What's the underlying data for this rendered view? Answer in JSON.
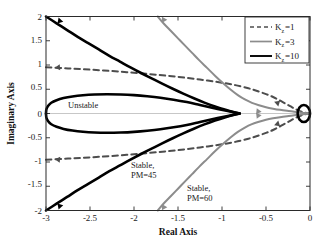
{
  "figure": {
    "background": "#ffffff",
    "frame_color": "#2a2a2a"
  },
  "chart_data": {
    "type": "line",
    "title": "",
    "xlabel": "Real Axis",
    "ylabel": "Imaginary Axis",
    "xlim": [
      -3,
      0
    ],
    "ylim": [
      -2,
      2
    ],
    "xticks": [
      -3,
      -2.5,
      -2,
      -1.5,
      -1,
      -0.5,
      0
    ],
    "xtick_labels": [
      "-3",
      "-2.5",
      "-2",
      "-1.5",
      "-1",
      "-0.5",
      "0"
    ],
    "yticks": [
      2,
      1.5,
      1,
      0.5,
      0,
      -0.5,
      -1,
      -1.5,
      -2
    ],
    "ytick_labels": [
      "2",
      "1.5",
      "1",
      "0.5",
      "0",
      "-0.5",
      "-1",
      "-1.5",
      "-2"
    ],
    "grid": false,
    "legend_position": "upper right",
    "series": [
      {
        "name": "K_z=1",
        "label_base": "K",
        "label_sub": "z",
        "label_value": "=1",
        "style": "dashed",
        "color": "#4d4d4d",
        "width": 2.0,
        "points_upper": [
          [
            -3.0,
            0.955
          ],
          [
            -2.75,
            0.93
          ],
          [
            -2.5,
            0.905
          ],
          [
            -2.25,
            0.875
          ],
          [
            -2.0,
            0.84
          ],
          [
            -1.75,
            0.8
          ],
          [
            -1.5,
            0.755
          ],
          [
            -1.25,
            0.7
          ],
          [
            -1.0,
            0.635
          ],
          [
            -0.85,
            0.585
          ],
          [
            -0.7,
            0.52
          ],
          [
            -0.6,
            0.465
          ],
          [
            -0.5,
            0.4
          ],
          [
            -0.42,
            0.34
          ],
          [
            -0.35,
            0.275
          ],
          [
            -0.28,
            0.205
          ],
          [
            -0.22,
            0.145
          ],
          [
            -0.17,
            0.095
          ],
          [
            -0.12,
            0.055
          ],
          [
            -0.07,
            0.025
          ],
          [
            -0.03,
            0.008
          ],
          [
            0.0,
            0.0
          ]
        ],
        "points_lower": [
          [
            -3.0,
            -0.955
          ],
          [
            -2.75,
            -0.93
          ],
          [
            -2.5,
            -0.905
          ],
          [
            -2.25,
            -0.875
          ],
          [
            -2.0,
            -0.84
          ],
          [
            -1.75,
            -0.8
          ],
          [
            -1.5,
            -0.755
          ],
          [
            -1.25,
            -0.7
          ],
          [
            -1.0,
            -0.635
          ],
          [
            -0.85,
            -0.585
          ],
          [
            -0.7,
            -0.52
          ],
          [
            -0.6,
            -0.465
          ],
          [
            -0.5,
            -0.4
          ],
          [
            -0.42,
            -0.34
          ],
          [
            -0.35,
            -0.275
          ],
          [
            -0.28,
            -0.205
          ],
          [
            -0.22,
            -0.145
          ],
          [
            -0.17,
            -0.095
          ],
          [
            -0.12,
            -0.055
          ],
          [
            -0.07,
            -0.025
          ],
          [
            -0.03,
            -0.008
          ],
          [
            0.0,
            0.0
          ]
        ]
      },
      {
        "name": "K_z=3",
        "label_base": "K",
        "label_sub": "z",
        "label_value": "=3",
        "style": "solid",
        "color": "#8c8c8c",
        "width": 2.0,
        "points_upper": [
          [
            -1.73,
            2.0
          ],
          [
            -1.66,
            1.85
          ],
          [
            -1.58,
            1.7
          ],
          [
            -1.5,
            1.55
          ],
          [
            -1.42,
            1.4
          ],
          [
            -1.34,
            1.25
          ],
          [
            -1.26,
            1.1
          ],
          [
            -1.17,
            0.94
          ],
          [
            -1.08,
            0.78
          ],
          [
            -0.99,
            0.63
          ],
          [
            -0.9,
            0.49
          ],
          [
            -0.82,
            0.38
          ],
          [
            -0.74,
            0.29
          ],
          [
            -0.66,
            0.22
          ],
          [
            -0.58,
            0.17
          ],
          [
            -0.5,
            0.13
          ],
          [
            -0.42,
            0.1
          ],
          [
            -0.34,
            0.075
          ],
          [
            -0.26,
            0.055
          ],
          [
            -0.18,
            0.038
          ],
          [
            -0.11,
            0.022
          ],
          [
            -0.05,
            0.009
          ],
          [
            0.0,
            0.0
          ]
        ],
        "points_lower": [
          [
            -1.73,
            -2.0
          ],
          [
            -1.66,
            -1.85
          ],
          [
            -1.58,
            -1.7
          ],
          [
            -1.5,
            -1.55
          ],
          [
            -1.42,
            -1.4
          ],
          [
            -1.34,
            -1.25
          ],
          [
            -1.26,
            -1.1
          ],
          [
            -1.17,
            -0.94
          ],
          [
            -1.08,
            -0.78
          ],
          [
            -0.99,
            -0.63
          ],
          [
            -0.9,
            -0.49
          ],
          [
            -0.82,
            -0.38
          ],
          [
            -0.74,
            -0.29
          ],
          [
            -0.66,
            -0.22
          ],
          [
            -0.58,
            -0.17
          ],
          [
            -0.5,
            -0.13
          ],
          [
            -0.42,
            -0.1
          ],
          [
            -0.34,
            -0.075
          ],
          [
            -0.26,
            -0.055
          ],
          [
            -0.18,
            -0.038
          ],
          [
            -0.11,
            -0.022
          ],
          [
            -0.05,
            -0.009
          ],
          [
            0.0,
            0.0
          ]
        ]
      },
      {
        "name": "K_z=10",
        "label_base": "K",
        "label_sub": "z",
        "label_value": "=10",
        "style": "solid",
        "color": "#000000",
        "width": 2.6,
        "branch_a_upper": [
          [
            -3.0,
            2.0
          ],
          [
            -2.88,
            1.86
          ],
          [
            -2.76,
            1.72
          ],
          [
            -2.64,
            1.58
          ],
          [
            -2.52,
            1.45
          ],
          [
            -2.4,
            1.32
          ],
          [
            -2.28,
            1.19
          ],
          [
            -2.16,
            1.07
          ],
          [
            -2.04,
            0.95
          ],
          [
            -1.92,
            0.835
          ],
          [
            -1.8,
            0.725
          ],
          [
            -1.68,
            0.615
          ],
          [
            -1.56,
            0.51
          ],
          [
            -1.44,
            0.41
          ],
          [
            -1.32,
            0.315
          ],
          [
            -1.2,
            0.225
          ],
          [
            -1.08,
            0.145
          ],
          [
            -0.96,
            0.075
          ],
          [
            -0.86,
            0.025
          ],
          [
            -0.8,
            0.0
          ]
        ],
        "branch_a_lower": [
          [
            -3.0,
            -2.0
          ],
          [
            -2.88,
            -1.86
          ],
          [
            -2.76,
            -1.72
          ],
          [
            -2.64,
            -1.58
          ],
          [
            -2.52,
            -1.45
          ],
          [
            -2.4,
            -1.32
          ],
          [
            -2.28,
            -1.19
          ],
          [
            -2.16,
            -1.07
          ],
          [
            -2.04,
            -0.95
          ],
          [
            -1.92,
            -0.835
          ],
          [
            -1.8,
            -0.725
          ],
          [
            -1.68,
            -0.615
          ],
          [
            -1.56,
            -0.51
          ],
          [
            -1.44,
            -0.41
          ],
          [
            -1.32,
            -0.315
          ],
          [
            -1.2,
            -0.225
          ],
          [
            -1.08,
            -0.145
          ],
          [
            -0.96,
            -0.075
          ],
          [
            -0.86,
            -0.025
          ],
          [
            -0.8,
            0.0
          ]
        ],
        "loop_upper": [
          [
            -0.8,
            0.0
          ],
          [
            -0.95,
            0.055
          ],
          [
            -1.1,
            0.115
          ],
          [
            -1.25,
            0.175
          ],
          [
            -1.4,
            0.235
          ],
          [
            -1.55,
            0.285
          ],
          [
            -1.7,
            0.325
          ],
          [
            -1.85,
            0.355
          ],
          [
            -2.0,
            0.378
          ],
          [
            -2.15,
            0.392
          ],
          [
            -2.3,
            0.398
          ],
          [
            -2.45,
            0.393
          ],
          [
            -2.58,
            0.378
          ],
          [
            -2.7,
            0.352
          ],
          [
            -2.8,
            0.318
          ],
          [
            -2.88,
            0.275
          ],
          [
            -2.94,
            0.222
          ],
          [
            -2.975,
            0.16
          ],
          [
            -2.995,
            0.09
          ],
          [
            -3.0,
            0.0
          ]
        ],
        "loop_lower": [
          [
            -0.8,
            0.0
          ],
          [
            -0.95,
            -0.055
          ],
          [
            -1.1,
            -0.115
          ],
          [
            -1.25,
            -0.175
          ],
          [
            -1.4,
            -0.235
          ],
          [
            -1.55,
            -0.285
          ],
          [
            -1.7,
            -0.325
          ],
          [
            -1.85,
            -0.355
          ],
          [
            -2.0,
            -0.378
          ],
          [
            -2.15,
            -0.392
          ],
          [
            -2.3,
            -0.398
          ],
          [
            -2.45,
            -0.393
          ],
          [
            -2.58,
            -0.378
          ],
          [
            -2.7,
            -0.352
          ],
          [
            -2.8,
            -0.318
          ],
          [
            -2.88,
            -0.275
          ],
          [
            -2.94,
            -0.222
          ],
          [
            -2.975,
            -0.16
          ],
          [
            -2.995,
            -0.09
          ],
          [
            -3.0,
            0.0
          ]
        ],
        "small_loop_note": "closed loop near origin"
      }
    ],
    "annotations": [
      {
        "text": "Unstable",
        "x": -2.22,
        "y": 0.3
      },
      {
        "text_line1": "Stable,",
        "text_line2": "PM=45",
        "x": -1.57,
        "y": -0.98
      },
      {
        "text_line1": "Stable,",
        "text_line2": "PM=60",
        "x": -0.94,
        "y": -1.52
      }
    ]
  },
  "legend": {
    "entries": [
      {
        "base": "K",
        "sub": "z",
        "rest": "=1",
        "style": "dashed",
        "color": "#4d4d4d"
      },
      {
        "base": "K",
        "sub": "z",
        "rest": "=3",
        "style": "solid",
        "color": "#8c8c8c"
      },
      {
        "base": "K",
        "sub": "z",
        "rest": "=10",
        "style": "solid",
        "color": "#000000"
      }
    ]
  },
  "annotations": {
    "unstable": "Unstable",
    "stable45_l1": "Stable,",
    "stable45_l2": "PM=45",
    "stable60_l1": "Stable,",
    "stable60_l2": "PM=60"
  },
  "axes": {
    "xlabel": "Real Axis",
    "ylabel": "Imaginary Axis",
    "x_tick_0": "-3",
    "x_tick_1": "-2.5",
    "x_tick_2": "-2",
    "x_tick_3": "-1.5",
    "x_tick_4": "-1",
    "x_tick_5": "-0.5",
    "x_tick_6": "0",
    "y_tick_0": "2",
    "y_tick_1": "1.5",
    "y_tick_2": "1",
    "y_tick_3": "0.5",
    "y_tick_4": "0",
    "y_tick_5": "-0.5",
    "y_tick_6": "-1",
    "y_tick_7": "-1.5",
    "y_tick_8": "-2"
  }
}
